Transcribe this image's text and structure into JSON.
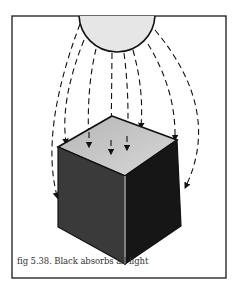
{
  "figure": {
    "caption": "fig 5.38. Black absorbs all light",
    "elements": {
      "light_source": "sun-circle",
      "rays": "dashed-arrows",
      "object": "black-cube"
    },
    "colors": {
      "frame": "#1a1a1a",
      "sun_fill": "#e6e6e6",
      "cube_top": "#c4c4c4",
      "cube_left": "#3a3a3a",
      "cube_right": "#161616"
    }
  }
}
